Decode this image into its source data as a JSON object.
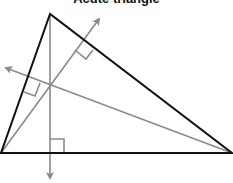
{
  "diagram": {
    "title": "Acute triangle",
    "colors": {
      "triangle": "#111111",
      "altitudes": "#8a8a8a"
    },
    "triangle": {
      "vertices": [
        [
          50,
          14
        ],
        [
          1,
          153
        ],
        [
          232,
          153
        ]
      ]
    },
    "orthocenter": [
      50,
      84
    ],
    "altitudes": [
      {
        "from": [
          50,
          14
        ],
        "to_arrow": [
          50,
          181
        ],
        "right_angle_at": [
          50,
          153
        ]
      },
      {
        "from": [
          1,
          153
        ],
        "to_arrow": [
          101,
          16
        ],
        "right_angle_at": [
          82,
          55
        ]
      },
      {
        "from": [
          232,
          153
        ],
        "to_arrow": [
          3,
          67
        ],
        "right_angle_at": [
          30,
          88
        ]
      }
    ]
  }
}
